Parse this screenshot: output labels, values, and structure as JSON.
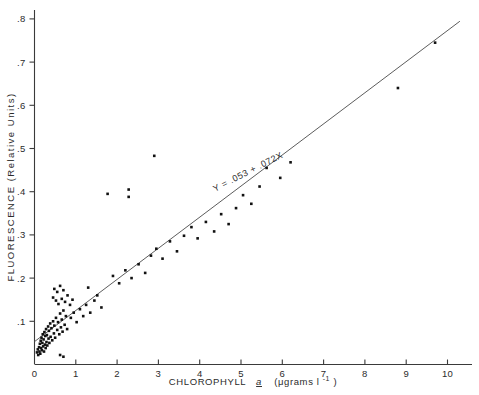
{
  "figure": {
    "name": "chlorophyll-fluorescence-scatter",
    "background_color": "#ffffff",
    "ink_color": "#111111"
  },
  "chart_data": {
    "type": "scatter",
    "title": "",
    "xlabel": "CHLOROPHYLL a  (μgrams l⁻¹)",
    "xlabel_parts": {
      "main": "CHLOROPHYLL",
      "species": "a",
      "units": "(μgrams l",
      "exponent": "-1",
      "close": ")"
    },
    "ylabel": "FLUORESCENCE (Relative Units)",
    "xlim": [
      0,
      10.6
    ],
    "ylim": [
      0,
      0.81
    ],
    "grid": false,
    "legend": false,
    "xticks": [
      0,
      1,
      2,
      3,
      4,
      5,
      6,
      7,
      8,
      9,
      10
    ],
    "xticklabels": [
      "0",
      "1",
      "2",
      "3",
      "4",
      "5",
      "6",
      "7",
      "8",
      "9",
      "10"
    ],
    "yticks": [
      0.1,
      0.2,
      0.3,
      0.4,
      0.5,
      0.6,
      0.7,
      0.8
    ],
    "yticklabels": [
      ".1",
      ".2",
      ".3",
      ".4",
      ".5",
      ".6",
      ".7",
      ".8"
    ],
    "annotations": [
      {
        "name": "regression-equation",
        "text": "Y = .053 + .072X",
        "x": 5.2,
        "y": 0.44,
        "rotation_deg": -27
      }
    ],
    "fit": {
      "type": "linear",
      "intercept": 0.053,
      "slope": 0.072,
      "x_start": 0.0,
      "x_end": 10.3,
      "equation": "Y = .053 + .072X"
    },
    "series": [
      {
        "name": "samples",
        "marker": "filled-square",
        "marker_size": 2.6,
        "color": "#111111",
        "points": [
          [
            0.06,
            0.028
          ],
          [
            0.08,
            0.035
          ],
          [
            0.09,
            0.022
          ],
          [
            0.11,
            0.04
          ],
          [
            0.12,
            0.03
          ],
          [
            0.13,
            0.048
          ],
          [
            0.14,
            0.025
          ],
          [
            0.15,
            0.055
          ],
          [
            0.16,
            0.038
          ],
          [
            0.17,
            0.062
          ],
          [
            0.18,
            0.033
          ],
          [
            0.19,
            0.05
          ],
          [
            0.2,
            0.07
          ],
          [
            0.21,
            0.042
          ],
          [
            0.22,
            0.058
          ],
          [
            0.23,
            0.03
          ],
          [
            0.24,
            0.075
          ],
          [
            0.25,
            0.046
          ],
          [
            0.26,
            0.066
          ],
          [
            0.27,
            0.038
          ],
          [
            0.28,
            0.082
          ],
          [
            0.29,
            0.052
          ],
          [
            0.3,
            0.068
          ],
          [
            0.31,
            0.044
          ],
          [
            0.33,
            0.088
          ],
          [
            0.34,
            0.06
          ],
          [
            0.35,
            0.078
          ],
          [
            0.36,
            0.05
          ],
          [
            0.38,
            0.095
          ],
          [
            0.39,
            0.064
          ],
          [
            0.41,
            0.084
          ],
          [
            0.43,
            0.056
          ],
          [
            0.45,
            0.1
          ],
          [
            0.47,
            0.072
          ],
          [
            0.48,
            0.09
          ],
          [
            0.5,
            0.062
          ],
          [
            0.52,
            0.108
          ],
          [
            0.55,
            0.08
          ],
          [
            0.57,
            0.098
          ],
          [
            0.6,
            0.07
          ],
          [
            0.62,
            0.118
          ],
          [
            0.64,
            0.086
          ],
          [
            0.66,
            0.104
          ],
          [
            0.68,
            0.076
          ],
          [
            0.7,
            0.125
          ],
          [
            0.73,
            0.092
          ],
          [
            0.76,
            0.112
          ],
          [
            0.79,
            0.082
          ],
          [
            0.45,
            0.155
          ],
          [
            0.48,
            0.175
          ],
          [
            0.52,
            0.148
          ],
          [
            0.55,
            0.168
          ],
          [
            0.58,
            0.14
          ],
          [
            0.62,
            0.182
          ],
          [
            0.66,
            0.152
          ],
          [
            0.7,
            0.172
          ],
          [
            0.74,
            0.145
          ],
          [
            0.8,
            0.16
          ],
          [
            0.86,
            0.138
          ],
          [
            0.92,
            0.15
          ],
          [
            0.62,
            0.022
          ],
          [
            0.7,
            0.018
          ],
          [
            0.88,
            0.108
          ],
          [
            0.95,
            0.12
          ],
          [
            1.02,
            0.098
          ],
          [
            1.1,
            0.128
          ],
          [
            1.18,
            0.112
          ],
          [
            1.25,
            0.138
          ],
          [
            1.35,
            0.12
          ],
          [
            1.45,
            0.148
          ],
          [
            1.3,
            0.178
          ],
          [
            1.52,
            0.16
          ],
          [
            1.62,
            0.132
          ],
          [
            1.77,
            0.395
          ],
          [
            2.28,
            0.405
          ],
          [
            2.28,
            0.388
          ],
          [
            1.9,
            0.205
          ],
          [
            2.05,
            0.188
          ],
          [
            2.2,
            0.218
          ],
          [
            2.35,
            0.2
          ],
          [
            2.52,
            0.232
          ],
          [
            2.68,
            0.212
          ],
          [
            2.82,
            0.252
          ],
          [
            2.95,
            0.268
          ],
          [
            2.9,
            0.483
          ],
          [
            3.1,
            0.245
          ],
          [
            3.28,
            0.285
          ],
          [
            3.45,
            0.262
          ],
          [
            3.62,
            0.298
          ],
          [
            3.8,
            0.318
          ],
          [
            3.95,
            0.292
          ],
          [
            4.15,
            0.33
          ],
          [
            4.35,
            0.308
          ],
          [
            4.52,
            0.348
          ],
          [
            4.7,
            0.325
          ],
          [
            4.88,
            0.362
          ],
          [
            5.05,
            0.392
          ],
          [
            5.25,
            0.372
          ],
          [
            5.45,
            0.412
          ],
          [
            5.62,
            0.455
          ],
          [
            5.95,
            0.432
          ],
          [
            6.2,
            0.468
          ],
          [
            8.8,
            0.64
          ],
          [
            9.7,
            0.745
          ]
        ]
      }
    ]
  }
}
